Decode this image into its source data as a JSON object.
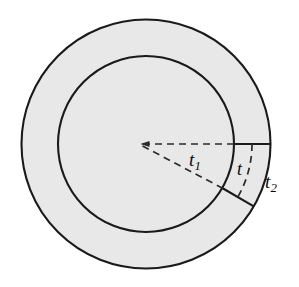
{
  "figure": {
    "canvas": {
      "width": 299,
      "height": 287,
      "background": "#ffffff"
    },
    "geometry": {
      "center_x": 146,
      "center_y": 144,
      "outer_radius": 125,
      "inner_radius": 88,
      "horizontal_ray_angle_deg": 0,
      "slanted_ray_angle_deg": 30,
      "arc_radius": 106
    },
    "colors": {
      "fill": "#e8e8e8",
      "stroke": "#1a1a1a",
      "dashed_stroke": "#2b2b2b",
      "label": "#0d0d0d"
    },
    "shapes": {
      "outer_circle_name": "outer-circle",
      "inner_circle_name": "inner-circle",
      "annulus_name": "annulus-region"
    },
    "labels": [
      {
        "id": "t1",
        "base": "t",
        "subscript": "1",
        "description": "inner radius thickness"
      },
      {
        "id": "t",
        "base": "t",
        "subscript": "",
        "description": "annulus wall thickness"
      },
      {
        "id": "t2",
        "base": "t",
        "subscript": "2",
        "description": "outer radius thickness"
      }
    ]
  }
}
